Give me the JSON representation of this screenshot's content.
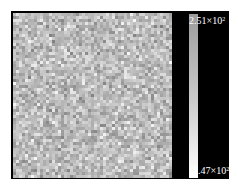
{
  "chart_data": {
    "type": "heatmap",
    "title": "",
    "xlabel": "",
    "ylabel": "",
    "colormap": "gray",
    "grid_size_approx": [
      53,
      55
    ],
    "colorbar": {
      "max_label": {
        "mantissa": "2.51",
        "times": "×10",
        "exponent": "2"
      },
      "min_label": {
        "mantissa": "1.47",
        "times": "×10",
        "exponent": "2"
      },
      "max_value": 251,
      "min_value": 147,
      "colors": {
        "top": "#9c9c9c",
        "bottom": "#ffffff"
      }
    }
  }
}
